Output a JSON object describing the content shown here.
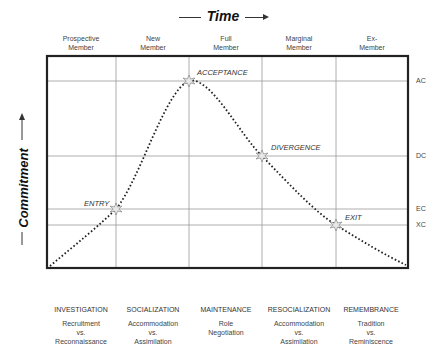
{
  "title": {
    "time_label": "Time",
    "commitment_label": "Commitment"
  },
  "stages": [
    {
      "line1": "Prospective",
      "line2": "Member"
    },
    {
      "line1": "New",
      "line2": "Member"
    },
    {
      "line1": "Full",
      "line2": "Member"
    },
    {
      "line1": "Marginal",
      "line2": "Member"
    },
    {
      "line1": "Ex-",
      "line2": "Member"
    }
  ],
  "phases": [
    {
      "title": "INVESTIGATION",
      "sub1": "Recruitment",
      "sub2": "vs.",
      "sub3": "Reconnaissance"
    },
    {
      "title": "SOCIALIZATION",
      "sub1": "Accommodation",
      "sub2": "vs.",
      "sub3": "Assimilation"
    },
    {
      "title": "MAINTENANCE",
      "sub1": "Role",
      "sub2": "Negotiation",
      "sub3": ""
    },
    {
      "title": "RESOCIALIZATION",
      "sub1": "Accommodation",
      "sub2": "vs.",
      "sub3": "Assimilation"
    },
    {
      "title": "REMEMBRANCE",
      "sub1": "Tradition",
      "sub2": "vs.",
      "sub3": "Reminiscence"
    }
  ],
  "levels": [
    {
      "label": "AC",
      "y": 81
    },
    {
      "label": "DC",
      "y": 156
    },
    {
      "label": "EC",
      "y": 209
    },
    {
      "label": "XC",
      "y": 225
    }
  ],
  "events": [
    {
      "label": "ENTRY",
      "x": 116,
      "y": 209
    },
    {
      "label": "ACCEPTANCE",
      "x": 189,
      "y": 81
    },
    {
      "label": "DIVERGENCE",
      "x": 262,
      "y": 156
    },
    {
      "label": "EXIT",
      "x": 336,
      "y": 225
    }
  ],
  "colors": {
    "frame": "#222222",
    "grid": "#9a9a9a",
    "curve": "#222222",
    "marker_fill": "#e8e8e8"
  }
}
